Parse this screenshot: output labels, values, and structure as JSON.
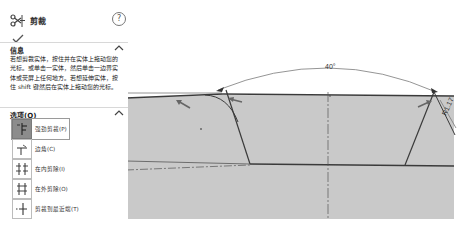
{
  "panel": {
    "title": "剪裁",
    "help_label": "?",
    "ok_icon": "check-icon",
    "info": {
      "heading": "信息",
      "caret": "^",
      "text": "若想剪裁实体，按住并在实体上拖动您的光标。或单击一实体，然后单击一边界实体或荧屏上任何地方。若想延伸实体，按住 shift 键然后在实体上拖动您的光标。"
    },
    "options": {
      "heading": "选项(O)",
      "caret": "^",
      "items": [
        {
          "label": "强劲剪裁(P)",
          "icon": "power-trim-icon",
          "selected": true
        },
        {
          "label": "边角(C)",
          "icon": "corner-trim-icon",
          "selected": false
        },
        {
          "label": "在内剪除(I)",
          "icon": "trim-away-inside-icon",
          "selected": false
        },
        {
          "label": "在外剪除(O)",
          "icon": "trim-away-outside-icon",
          "selected": false
        },
        {
          "label": "剪裁到最近端(T)",
          "icon": "trim-to-closest-icon",
          "selected": false
        }
      ]
    }
  },
  "sketch": {
    "angle_dimension": "40°",
    "radius_dimension": "R1.17",
    "colors": {
      "fill": "#c8c8c8",
      "line": "#3a3a3a",
      "dim": "#6f6f6f",
      "arrow": "#555555"
    }
  }
}
